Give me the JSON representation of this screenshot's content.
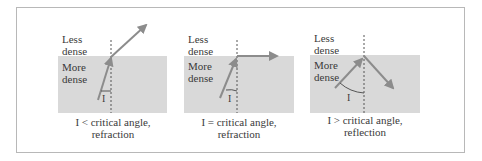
{
  "figure": {
    "colors": {
      "dense_medium": "#d9d9d9",
      "ray": "#8c8c8c",
      "normal_line": "#555555",
      "frame_border": "#b8b8b8",
      "text": "#3a3a3a"
    },
    "panels": [
      {
        "id": "panel-1",
        "less_dense_label_line1": "Less",
        "less_dense_label_line2": "dense",
        "more_dense_label_line1": "More",
        "more_dense_label_line2": "dense",
        "angle_label": "I",
        "caption_line1": "I < critical angle,",
        "caption_line2": "refraction",
        "ray_behavior": "refracted away from normal into less dense medium"
      },
      {
        "id": "panel-2",
        "less_dense_label_line1": "Less",
        "less_dense_label_line2": "dense",
        "more_dense_label_line1": "More",
        "more_dense_label_line2": "dense",
        "angle_label": "I",
        "caption_line1": "I = critical angle,",
        "caption_line2": "refraction",
        "ray_behavior": "refracted along the boundary"
      },
      {
        "id": "panel-3",
        "less_dense_label_line1": "Less",
        "less_dense_label_line2": "dense",
        "more_dense_label_line1": "More",
        "more_dense_label_line2": "dense",
        "angle_label": "I",
        "caption_line1": "I > critical angle,",
        "caption_line2": "reflection",
        "ray_behavior": "totally internally reflected back into dense medium"
      }
    ]
  }
}
